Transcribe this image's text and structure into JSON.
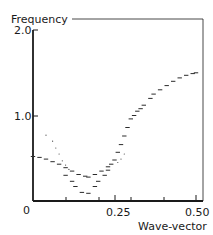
{
  "chart_data": {
    "type": "scatter",
    "title": "",
    "xlabel": "Wave-vector",
    "ylabel": "Frequency",
    "xlim": [
      0,
      0.52
    ],
    "ylim": [
      0,
      2.0
    ],
    "x_tick_labels": [
      "0",
      "0.25",
      "0.50"
    ],
    "x_tick_values": [
      0,
      0.25,
      0.5
    ],
    "x_minor_ticks": [
      0.1,
      0.2,
      0.3,
      0.4
    ],
    "y_tick_labels": [
      "2.0",
      "1.0"
    ],
    "y_tick_values": [
      2.0,
      1.0
    ],
    "y_zero_label": "0",
    "grid": false,
    "legend": null,
    "frame": "open-top-right-box",
    "series": [
      {
        "name": "upper-branch",
        "marker": "dash",
        "points": [
          [
            0.0,
            0.52
          ],
          [
            0.02,
            0.51
          ],
          [
            0.04,
            0.49
          ],
          [
            0.06,
            0.46
          ],
          [
            0.08,
            0.43
          ],
          [
            0.1,
            0.39
          ],
          [
            0.12,
            0.35
          ],
          [
            0.14,
            0.31
          ],
          [
            0.16,
            0.29
          ],
          [
            0.17,
            0.28
          ],
          [
            0.19,
            0.31
          ],
          [
            0.21,
            0.35
          ],
          [
            0.23,
            0.4
          ],
          [
            0.25,
            0.48
          ],
          [
            0.26,
            0.57
          ],
          [
            0.27,
            0.66
          ],
          [
            0.28,
            0.76
          ],
          [
            0.29,
            0.86
          ],
          [
            0.3,
            0.96
          ],
          [
            0.31,
            1.0
          ],
          [
            0.32,
            1.05
          ],
          [
            0.33,
            1.08
          ],
          [
            0.34,
            1.12
          ],
          [
            0.36,
            1.2
          ],
          [
            0.37,
            1.25
          ],
          [
            0.39,
            1.3
          ],
          [
            0.41,
            1.35
          ],
          [
            0.43,
            1.4
          ],
          [
            0.45,
            1.44
          ],
          [
            0.47,
            1.47
          ],
          [
            0.49,
            1.49
          ],
          [
            0.5,
            1.5
          ]
        ]
      },
      {
        "name": "lower-branch",
        "marker": "dash",
        "points": [
          [
            0.1,
            0.3
          ],
          [
            0.12,
            0.23
          ],
          [
            0.13,
            0.17
          ],
          [
            0.15,
            0.1
          ],
          [
            0.17,
            0.09
          ],
          [
            0.19,
            0.17
          ],
          [
            0.2,
            0.23
          ],
          [
            0.22,
            0.3
          ],
          [
            0.23,
            0.36
          ],
          [
            0.24,
            0.43
          ]
        ]
      },
      {
        "name": "dotted-branch",
        "marker": "dot",
        "points": [
          [
            0.04,
            0.77
          ],
          [
            0.06,
            0.7
          ],
          [
            0.07,
            0.62
          ],
          [
            0.08,
            0.55
          ],
          [
            0.09,
            0.47
          ],
          [
            0.1,
            0.42
          ],
          [
            0.11,
            0.37
          ],
          [
            0.26,
            0.45
          ],
          [
            0.27,
            0.49
          ],
          [
            0.28,
            0.55
          ]
        ]
      }
    ]
  },
  "axes": {
    "y_title": "Frequency",
    "x_title": "Wave-vector",
    "y_ticks": [
      "2.0",
      "1.0"
    ],
    "origin": "0",
    "x_ticks": [
      "0.25",
      "0.50"
    ]
  }
}
